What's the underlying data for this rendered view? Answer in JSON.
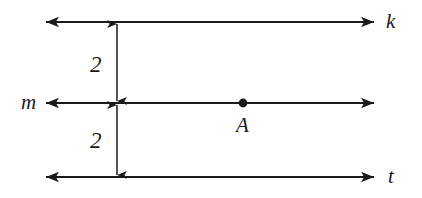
{
  "diagram": {
    "type": "geometry-parallel-lines",
    "background_color": "#ffffff",
    "stroke_color": "#1a1a1a",
    "lines": [
      {
        "id": "k",
        "label": "k",
        "label_side": "right",
        "y": 22
      },
      {
        "id": "m",
        "label": "m",
        "label_side": "left",
        "y": 103
      },
      {
        "id": "t",
        "label": "t",
        "label_side": "right",
        "y": 177
      }
    ],
    "measurements": [
      {
        "id": "dist-k-m",
        "label": "2",
        "from_line": "k",
        "to_line": "m"
      },
      {
        "id": "dist-m-t",
        "label": "2",
        "from_line": "m",
        "to_line": "t"
      }
    ],
    "points": [
      {
        "id": "A",
        "label": "A",
        "on_line": "m",
        "x": 243,
        "y": 103
      }
    ]
  }
}
